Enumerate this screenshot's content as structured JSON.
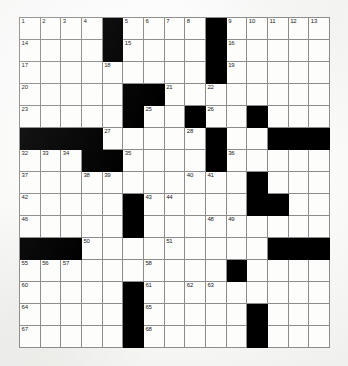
{
  "puzzle": {
    "type": "crossword-grid",
    "title": "",
    "rows": 15,
    "cols": 15,
    "colors": {
      "block": "#000000",
      "cell": "#fdfdfb",
      "gridline": "#8c8c8c",
      "number": "#1a1a1a",
      "page": "#fdfdfc"
    },
    "legend": {
      "block_char": "#",
      "open_char": "."
    },
    "grid_rows": [
      "....#....#.....",
      "....#....#.....",
      ".........#.....",
      ".....##........",
      ".....#..#..#...",
      "####.....#..###",
      "...##....#.....",
      "...........#...",
      ".....#.....##..",
      ".....#.........",
      "###.........###",
      "..........#....",
      ".....#.........",
      ".....#.....#...",
      ".....#.....#..."
    ],
    "numbers": [
      {
        "row": 1,
        "col": 1,
        "n": 1
      },
      {
        "row": 1,
        "col": 2,
        "n": 2
      },
      {
        "row": 1,
        "col": 3,
        "n": 3
      },
      {
        "row": 1,
        "col": 4,
        "n": 4
      },
      {
        "row": 1,
        "col": 6,
        "n": 5
      },
      {
        "row": 1,
        "col": 7,
        "n": 6
      },
      {
        "row": 1,
        "col": 8,
        "n": 7
      },
      {
        "row": 1,
        "col": 9,
        "n": 8
      },
      {
        "row": 1,
        "col": 11,
        "n": 9
      },
      {
        "row": 1,
        "col": 12,
        "n": 10
      },
      {
        "row": 1,
        "col": 13,
        "n": 11
      },
      {
        "row": 1,
        "col": 14,
        "n": 12
      },
      {
        "row": 1,
        "col": 15,
        "n": 13
      },
      {
        "row": 2,
        "col": 1,
        "n": 14
      },
      {
        "row": 2,
        "col": 6,
        "n": 15
      },
      {
        "row": 2,
        "col": 11,
        "n": 16
      },
      {
        "row": 3,
        "col": 1,
        "n": 17
      },
      {
        "row": 3,
        "col": 5,
        "n": 18
      },
      {
        "row": 3,
        "col": 11,
        "n": 19
      },
      {
        "row": 4,
        "col": 1,
        "n": 20
      },
      {
        "row": 4,
        "col": 8,
        "n": 21
      },
      {
        "row": 4,
        "col": 10,
        "n": 22
      },
      {
        "row": 5,
        "col": 1,
        "n": 23
      },
      {
        "row": 5,
        "col": 6,
        "n": 24
      },
      {
        "row": 5,
        "col": 7,
        "n": 25
      },
      {
        "row": 5,
        "col": 10,
        "n": 26
      },
      {
        "row": 6,
        "col": 5,
        "n": 27
      },
      {
        "row": 6,
        "col": 9,
        "n": 28
      },
      {
        "row": 6,
        "col": 13,
        "n": 29
      },
      {
        "row": 6,
        "col": 14,
        "n": 30
      },
      {
        "row": 6,
        "col": 15,
        "n": 31
      },
      {
        "row": 7,
        "col": 1,
        "n": 32
      },
      {
        "row": 7,
        "col": 2,
        "n": 33
      },
      {
        "row": 7,
        "col": 3,
        "n": 34
      },
      {
        "row": 7,
        "col": 6,
        "n": 35
      },
      {
        "row": 7,
        "col": 11,
        "n": 36
      },
      {
        "row": 8,
        "col": 1,
        "n": 37
      },
      {
        "row": 8,
        "col": 4,
        "n": 38
      },
      {
        "row": 8,
        "col": 5,
        "n": 39
      },
      {
        "row": 8,
        "col": 9,
        "n": 40
      },
      {
        "row": 8,
        "col": 10,
        "n": 41
      },
      {
        "row": 9,
        "col": 1,
        "n": 42
      },
      {
        "row": 9,
        "col": 7,
        "n": 43
      },
      {
        "row": 9,
        "col": 8,
        "n": 44
      },
      {
        "row": 9,
        "col": 12,
        "n": 45
      },
      {
        "row": 10,
        "col": 1,
        "n": 46
      },
      {
        "row": 10,
        "col": 6,
        "n": 47
      },
      {
        "row": 10,
        "col": 10,
        "n": 48
      },
      {
        "row": 10,
        "col": 11,
        "n": 49
      },
      {
        "row": 11,
        "col": 4,
        "n": 50
      },
      {
        "row": 11,
        "col": 8,
        "n": 51
      },
      {
        "row": 11,
        "col": 13,
        "n": 52
      },
      {
        "row": 11,
        "col": 14,
        "n": 53
      },
      {
        "row": 11,
        "col": 15,
        "n": 54
      },
      {
        "row": 12,
        "col": 1,
        "n": 55
      },
      {
        "row": 12,
        "col": 2,
        "n": 56
      },
      {
        "row": 12,
        "col": 3,
        "n": 57
      },
      {
        "row": 12,
        "col": 7,
        "n": 58
      },
      {
        "row": 12,
        "col": 11,
        "n": 59
      },
      {
        "row": 13,
        "col": 1,
        "n": 60
      },
      {
        "row": 13,
        "col": 7,
        "n": 61
      },
      {
        "row": 13,
        "col": 9,
        "n": 62
      },
      {
        "row": 13,
        "col": 10,
        "n": 63
      },
      {
        "row": 14,
        "col": 1,
        "n": 64
      },
      {
        "row": 14,
        "col": 7,
        "n": 65
      },
      {
        "row": 14,
        "col": 12,
        "n": 66
      },
      {
        "row": 15,
        "col": 1,
        "n": 67
      },
      {
        "row": 15,
        "col": 7,
        "n": 68
      },
      {
        "row": 15,
        "col": 12,
        "n": 69
      }
    ],
    "entries": []
  }
}
